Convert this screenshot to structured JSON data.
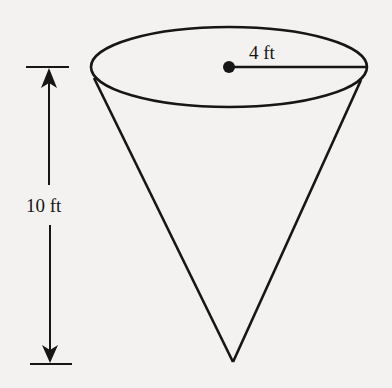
{
  "figure": {
    "type": "cone",
    "radius_label": "4 ft",
    "height_label": "10 ft",
    "colors": {
      "background": "#f3f2f0",
      "stroke": "#161616"
    }
  }
}
